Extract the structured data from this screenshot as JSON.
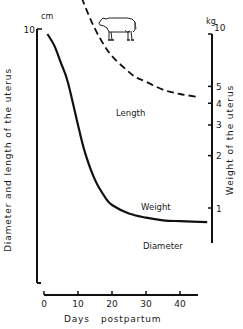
{
  "chart_data": {
    "type": "line",
    "title": "",
    "xlabel": "Days postpartum",
    "ylabel_left": "Diameter and length of the uterus",
    "ylabel_right": "Weight of the uterus",
    "unit_left": "cm",
    "unit_right": "kg",
    "xlim": [
      0,
      47
    ],
    "ylim_left": [
      4,
      100
    ],
    "ylim_right": [
      0.6,
      10
    ],
    "yscale": "log",
    "grid": false,
    "x_ticks": [
      0,
      10,
      20,
      30,
      40
    ],
    "y_ticks_left": [
      10,
      20,
      40,
      60,
      80,
      100
    ],
    "y_ticks_right": [
      1,
      2,
      3,
      4,
      5,
      10
    ],
    "illustration": "cow-icon",
    "series": [
      {
        "name": "Length",
        "axis": "left",
        "style": "dotted",
        "x": [
          2,
          4,
          7,
          10,
          13,
          16,
          20,
          25,
          30,
          35,
          40,
          47
        ],
        "values": [
          84,
          70,
          50,
          40,
          34,
          31,
          29.4,
          27,
          25.4,
          24,
          23.2,
          22.3
        ]
      },
      {
        "name": "Weight",
        "axis": "right",
        "style": "solid",
        "x": [
          1,
          3,
          5,
          7,
          10,
          12,
          15,
          18,
          20,
          25,
          30,
          35,
          40,
          48
        ],
        "values": [
          10,
          8.6,
          6.8,
          5.3,
          3.0,
          2.1,
          1.45,
          1.15,
          1.04,
          0.93,
          0.88,
          0.85,
          0.84,
          0.83
        ]
      },
      {
        "name": "Diameter",
        "axis": "left",
        "style": "dashed",
        "x": [
          2,
          5,
          8,
          10,
          14,
          17,
          20,
          24,
          27,
          30,
          35,
          40,
          45
        ],
        "values": [
          38,
          30,
          21,
          17,
          11,
          8.5,
          7.0,
          5.9,
          5.3,
          5.0,
          4.5,
          4.25,
          4.1
        ]
      }
    ],
    "annotations": [
      {
        "text": "Length",
        "x": 31,
        "y_left": 36
      },
      {
        "text": "Weight",
        "x": 33,
        "y_right": 1.08
      },
      {
        "text": "Diameter",
        "x": 34,
        "y_left": 5.6
      }
    ]
  },
  "labels": {
    "unit_left": "cm",
    "unit_right": "kg",
    "xlabel_days": "Days",
    "xlabel_post": "postpartum",
    "ylabel_left": "Diameter and length of the uterus",
    "ylabel_right": "Weight of the uterus",
    "length": "Length",
    "weight": "Weight",
    "diameter": "Diameter"
  }
}
